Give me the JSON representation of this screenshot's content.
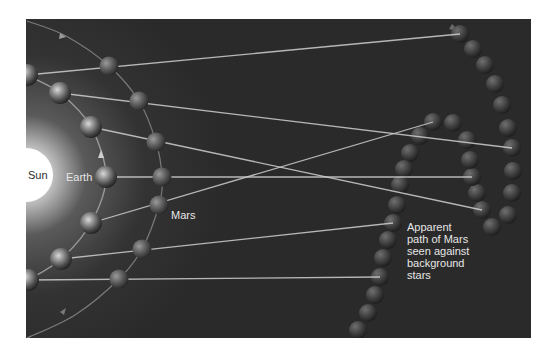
{
  "diagram": {
    "colors": {
      "background": "#ffffff",
      "panel": "#2a2a2a",
      "sun": "#ffffff",
      "sight_line": "#cfcfcf",
      "orbit": "#8a8a8a",
      "label_light": "#e6e6e6",
      "label_dark": "#2b2b2b"
    },
    "panel": {
      "x": 26,
      "y": 19,
      "width": 505,
      "height": 319
    },
    "sun": {
      "label": "Sun",
      "cx": 26,
      "cy": 175,
      "r": 27
    },
    "labels": {
      "sun": "Sun",
      "earth": "Earth",
      "mars": "Mars",
      "apparent_path": "Apparent\npath of Mars\nseen against\nbackground\nstars"
    },
    "earth_positions": [
      {
        "x": 27,
        "y": 75
      },
      {
        "x": 60,
        "y": 93
      },
      {
        "x": 91,
        "y": 127
      },
      {
        "x": 106,
        "y": 177
      },
      {
        "x": 91,
        "y": 223
      },
      {
        "x": 61,
        "y": 259
      },
      {
        "x": 28,
        "y": 280
      }
    ],
    "mars_positions": [
      {
        "x": 109,
        "y": 66
      },
      {
        "x": 139,
        "y": 101
      },
      {
        "x": 156,
        "y": 142
      },
      {
        "x": 162,
        "y": 177
      },
      {
        "x": 159,
        "y": 205
      },
      {
        "x": 142,
        "y": 249
      },
      {
        "x": 119,
        "y": 279
      }
    ],
    "sight_line_ends": [
      {
        "x": 460,
        "y": 34
      },
      {
        "x": 512,
        "y": 148
      },
      {
        "x": 482,
        "y": 210
      },
      {
        "x": 472,
        "y": 177
      },
      {
        "x": 433,
        "y": 122
      },
      {
        "x": 393,
        "y": 223
      },
      {
        "x": 380,
        "y": 277
      }
    ],
    "apparent_path": [
      {
        "x": 460,
        "y": 34
      },
      {
        "x": 473,
        "y": 49
      },
      {
        "x": 485,
        "y": 65
      },
      {
        "x": 495,
        "y": 84
      },
      {
        "x": 502,
        "y": 105
      },
      {
        "x": 508,
        "y": 128
      },
      {
        "x": 512,
        "y": 148
      },
      {
        "x": 513,
        "y": 171
      },
      {
        "x": 512,
        "y": 193
      },
      {
        "x": 508,
        "y": 215
      },
      {
        "x": 492,
        "y": 227
      },
      {
        "x": 482,
        "y": 210
      },
      {
        "x": 477,
        "y": 193
      },
      {
        "x": 472,
        "y": 177
      },
      {
        "x": 470,
        "y": 160
      },
      {
        "x": 467,
        "y": 140
      },
      {
        "x": 453,
        "y": 123
      },
      {
        "x": 433,
        "y": 122
      },
      {
        "x": 420,
        "y": 136
      },
      {
        "x": 410,
        "y": 153
      },
      {
        "x": 404,
        "y": 169
      },
      {
        "x": 400,
        "y": 185
      },
      {
        "x": 397,
        "y": 205
      },
      {
        "x": 393,
        "y": 223
      },
      {
        "x": 388,
        "y": 240
      },
      {
        "x": 383,
        "y": 258
      },
      {
        "x": 380,
        "y": 277
      },
      {
        "x": 375,
        "y": 295
      },
      {
        "x": 368,
        "y": 313
      },
      {
        "x": 358,
        "y": 330
      }
    ]
  }
}
